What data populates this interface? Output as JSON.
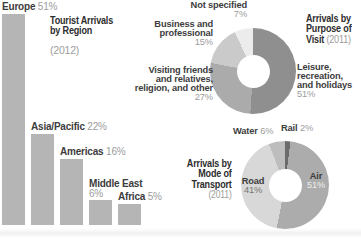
{
  "chart_data": [
    {
      "type": "bar",
      "title": "Tourist Arrivals by Region",
      "title_lines": [
        "Tourist Arrivals",
        "by Region"
      ],
      "year": "(2012)",
      "categories": [
        "Europe",
        "Asia/Pacific",
        "Americas",
        "Middle East",
        "Africa"
      ],
      "values": [
        51,
        22,
        16,
        6,
        5
      ],
      "unit": "%",
      "ylim": [
        0,
        51
      ],
      "bar_color": "#b5b5b5",
      "label_layout": [
        "inline",
        "inline",
        "inline",
        "stacked",
        "inline"
      ]
    },
    {
      "type": "pie",
      "donut": true,
      "title": "Arrivals by Purpose of Visit",
      "title_lines": [
        "Arrivals by",
        "Purpose of",
        "Visit"
      ],
      "year": "(2011)",
      "segments": [
        {
          "label": "Leisure, recreation, and holidays",
          "value": 51,
          "color": "#8f8f8f"
        },
        {
          "label": "Visiting friends and relatives, religion, and other",
          "value": 27,
          "color": "#ababab"
        },
        {
          "label": "Business and professional",
          "value": 15,
          "color": "#cacaca"
        },
        {
          "label": "Not specified",
          "value": 7,
          "color": "#ececec"
        }
      ],
      "callouts": {
        "not_specified": {
          "lines": [
            "Not specified"
          ],
          "pct": "7%"
        },
        "business": {
          "lines": [
            "Business and",
            "professional"
          ],
          "pct": "15%"
        },
        "visiting": {
          "lines": [
            "Visiting friends",
            "and relatives,",
            "religion, and other"
          ],
          "pct": "27%"
        },
        "leisure": {
          "lines": [
            "Leisure,",
            "recreation,",
            "and holidays"
          ],
          "pct": "51%"
        }
      }
    },
    {
      "type": "pie",
      "donut": true,
      "title": "Arrivals by Mode of Transport",
      "title_lines": [
        "Arrivals by",
        "Mode of",
        "Transport"
      ],
      "year": "(2011)",
      "segments": [
        {
          "label": "Rail",
          "value": 2,
          "color": "#6b6b6b"
        },
        {
          "label": "Air",
          "value": 51,
          "color": "#acacac"
        },
        {
          "label": "Road",
          "value": 41,
          "color": "#d8d8d8"
        },
        {
          "label": "Water",
          "value": 6,
          "color": "#bdbdbd"
        }
      ],
      "callouts": {
        "water": {
          "name": "Water",
          "pct": "6%"
        },
        "rail": {
          "name": "Rail",
          "pct": "2%"
        },
        "road": {
          "name": "Road",
          "pct": "41%"
        },
        "air": {
          "name": "Air",
          "pct": "51%"
        }
      }
    }
  ]
}
